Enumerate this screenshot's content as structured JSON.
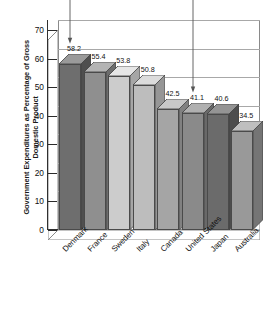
{
  "chart_data": {
    "type": "bar",
    "title": "",
    "xlabel": "",
    "ylabel": "Government Expenditures as Percentage of Gross Domestic Product",
    "ylim": [
      0,
      70
    ],
    "ytick_step": 10,
    "yticks": [
      "70",
      "60",
      "50",
      "40",
      "30",
      "20",
      "10",
      "0"
    ],
    "grid": true,
    "legend": "none",
    "style": "3d-column",
    "categories": [
      "Denmark",
      "France",
      "Sweden",
      "Italy",
      "Canada",
      "United States",
      "Japan",
      "Australia"
    ],
    "values": [
      58.2,
      55.4,
      53.8,
      50.8,
      42.5,
      41.1,
      40.6,
      34.5
    ],
    "value_labels": [
      "58.2",
      "55.4",
      "53.8",
      "50.8",
      "42.5",
      "41.1",
      "40.6",
      "34.5"
    ],
    "bar_colors": [
      "#6e6e6e",
      "#8f8f8f",
      "#cccccc",
      "#bdbdbd",
      "#a5a5a5",
      "#8a8a8a",
      "#6b6b6b",
      "#999999"
    ],
    "bar_top_colors": [
      "#9a9a9a",
      "#b4b4b4",
      "#e6e6e6",
      "#dcdcdc",
      "#c8c8c8",
      "#b0b0b0",
      "#949494",
      "#bfbfbf"
    ],
    "bar_side_colors": [
      "#4f4f4f",
      "#6d6d6d",
      "#a6a6a6",
      "#969696",
      "#818181",
      "#696969",
      "#4d4d4d",
      "#757575"
    ],
    "annotations": [
      {
        "name": "pointer-denmark",
        "target_category": "Denmark"
      },
      {
        "name": "pointer-united-states",
        "target_category": "United States"
      }
    ]
  },
  "axes": {
    "y_title": "Government Expenditures as Percentage of Gross Domestic Product"
  }
}
